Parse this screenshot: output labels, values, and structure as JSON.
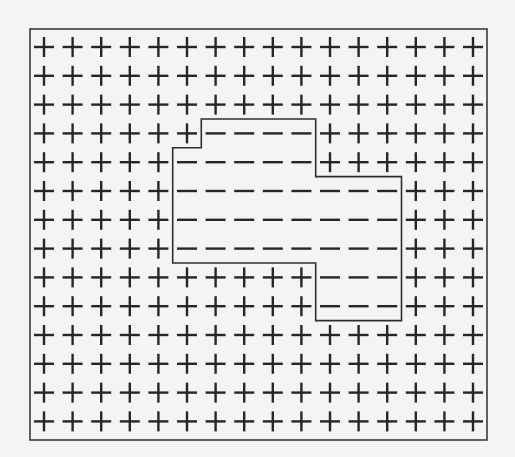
{
  "diagram": {
    "rows": 14,
    "cols": 16,
    "symbols": {
      "+": "plus-sign",
      "-": "minus-sign"
    },
    "grid": [
      "++++++++++++++++",
      "++++++++++++++++",
      "++++++++++++++++",
      "++++++----++++++",
      "+++++-----++++++",
      "+++++--------+++",
      "+++++--------+++",
      "+++++--------+++",
      "++++++++++---+++",
      "++++++++++---+++",
      "++++++++++++++++",
      "++++++++++++++++",
      "++++++++++++++++",
      "++++++++++++++++"
    ],
    "colors": {
      "background": "#f4f4f2",
      "ink": "#262626",
      "frame": "#3a3a3a"
    },
    "counts": {
      "plus": 180,
      "minus": 44
    }
  }
}
